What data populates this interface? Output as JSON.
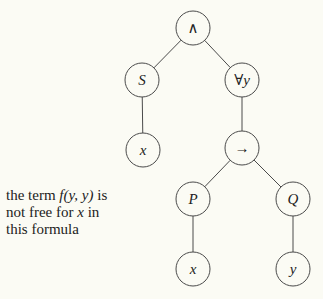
{
  "tree": {
    "nodes": [
      {
        "id": "and",
        "label": "∧",
        "italic": false,
        "name": "node-conjunction"
      },
      {
        "id": "S",
        "label": "S",
        "italic": true,
        "name": "node-S"
      },
      {
        "id": "forall",
        "label": "∀y",
        "italic": false,
        "name": "node-forall-y"
      },
      {
        "id": "x1",
        "label": "x",
        "italic": true,
        "name": "node-x-under-S"
      },
      {
        "id": "impl",
        "label": "→",
        "italic": false,
        "name": "node-implication"
      },
      {
        "id": "P",
        "label": "P",
        "italic": true,
        "name": "node-P"
      },
      {
        "id": "Q",
        "label": "Q",
        "italic": true,
        "name": "node-Q"
      },
      {
        "id": "x2",
        "label": "x",
        "italic": true,
        "name": "node-x-under-P"
      },
      {
        "id": "y",
        "label": "y",
        "italic": true,
        "name": "node-y"
      }
    ],
    "edges": [
      [
        "and",
        "S"
      ],
      [
        "and",
        "forall"
      ],
      [
        "S",
        "x1"
      ],
      [
        "forall",
        "impl"
      ],
      [
        "impl",
        "P"
      ],
      [
        "impl",
        "Q"
      ],
      [
        "P",
        "x2"
      ],
      [
        "Q",
        "y"
      ]
    ]
  },
  "caption": {
    "line1_prefix": "the term ",
    "line1_term": "f(y, y)",
    "line1_suffix": " is",
    "line2_prefix": "not free for ",
    "line2_var": "x",
    "line2_suffix": " in",
    "line3": "this formula"
  }
}
